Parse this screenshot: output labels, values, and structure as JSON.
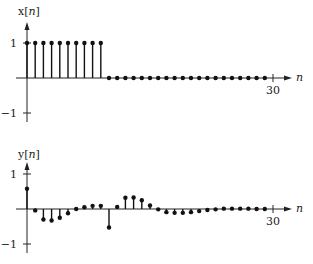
{
  "chart_data": [
    {
      "type": "stem",
      "ylabel": "x[n]",
      "ylabel_parts": {
        "prefix": "x[",
        "var": "n",
        "suffix": "]"
      },
      "xlabel": "n",
      "x_tick_labels": [
        "30"
      ],
      "x_ticks": [
        30
      ],
      "y_tick_labels": [
        "1",
        "−1"
      ],
      "y_ticks": [
        1,
        -1
      ],
      "xlim": [
        0,
        30
      ],
      "ylim": [
        -1,
        1
      ],
      "x": [
        0,
        1,
        2,
        3,
        4,
        5,
        6,
        7,
        8,
        9,
        10,
        11,
        12,
        13,
        14,
        15,
        16,
        17,
        18,
        19,
        20,
        21,
        22,
        23,
        24,
        25,
        26,
        27,
        28,
        29
      ],
      "values": [
        1,
        1,
        1,
        1,
        1,
        1,
        1,
        1,
        1,
        1,
        0,
        0,
        0,
        0,
        0,
        0,
        0,
        0,
        0,
        0,
        0,
        0,
        0,
        0,
        0,
        0,
        0,
        0,
        0,
        0
      ],
      "grid": false,
      "legend": "none"
    },
    {
      "type": "stem",
      "ylabel": "y[n]",
      "ylabel_parts": {
        "prefix": "y[",
        "var": "n",
        "suffix": "]"
      },
      "xlabel": "n",
      "x_tick_labels": [
        "30"
      ],
      "x_ticks": [
        30
      ],
      "y_tick_labels": [
        "1",
        "−1"
      ],
      "y_ticks": [
        1,
        -1
      ],
      "xlim": [
        0,
        30
      ],
      "ylim": [
        -1,
        1
      ],
      "x": [
        0,
        1,
        2,
        3,
        4,
        5,
        6,
        7,
        8,
        9,
        10,
        11,
        12,
        13,
        14,
        15,
        16,
        17,
        18,
        19,
        20,
        21,
        22,
        23,
        24,
        25,
        26,
        27,
        28,
        29
      ],
      "values": [
        0.58,
        -0.04,
        -0.3,
        -0.33,
        -0.25,
        -0.12,
        0.0,
        0.05,
        0.09,
        0.09,
        -0.53,
        0.06,
        0.32,
        0.33,
        0.25,
        0.1,
        -0.01,
        -0.09,
        -0.11,
        -0.11,
        -0.09,
        -0.06,
        -0.03,
        -0.01,
        0.01,
        0.01,
        0.01,
        0.01,
        0.0,
        0.0
      ],
      "grid": false,
      "legend": "none"
    }
  ]
}
